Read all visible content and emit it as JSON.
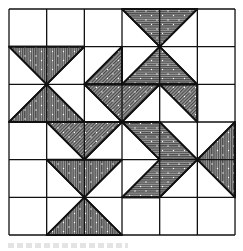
{
  "figure": {
    "type": "quilt-pattern-diagram",
    "grid": {
      "columns": 6,
      "rows": 6,
      "origin_px": [
        9,
        9
      ],
      "cell_px": 37.67,
      "line_color": "#111111",
      "background": "#ffffff"
    },
    "fill": {
      "base_color": "#8c8c8c",
      "hatch_color": "#3a3a3a",
      "speckle_color": "#ffffff"
    },
    "shapes": [
      {
        "id": "top-hourglass-upper",
        "hatch": "horizontal",
        "points": [
          [
            3,
            0
          ],
          [
            5,
            0
          ],
          [
            4,
            1
          ]
        ]
      },
      {
        "id": "center-triangle-up",
        "hatch": "horizontal",
        "points": [
          [
            4,
            1
          ],
          [
            3,
            2
          ],
          [
            5,
            2
          ]
        ]
      },
      {
        "id": "left-hourglass-upper",
        "hatch": "vertical",
        "points": [
          [
            0,
            1
          ],
          [
            2,
            1
          ],
          [
            1,
            2
          ]
        ]
      },
      {
        "id": "left-hourglass-lower",
        "hatch": "vertical",
        "points": [
          [
            1,
            2
          ],
          [
            0,
            3
          ],
          [
            2,
            3
          ]
        ]
      },
      {
        "id": "diag-half-left",
        "hatch": "diagonal",
        "points": [
          [
            3,
            1
          ],
          [
            3,
            2
          ],
          [
            2,
            2
          ]
        ]
      },
      {
        "id": "diag-triangle-down",
        "hatch": "diagonal",
        "points": [
          [
            2,
            2
          ],
          [
            4,
            2
          ],
          [
            3,
            3
          ]
        ]
      },
      {
        "id": "diag-half-right",
        "hatch": "diagonal",
        "points": [
          [
            4,
            2
          ],
          [
            5,
            2
          ],
          [
            5,
            3
          ]
        ]
      },
      {
        "id": "lower-diag-triangle-down",
        "hatch": "diagonal",
        "points": [
          [
            1,
            3
          ],
          [
            3,
            3
          ],
          [
            2,
            4
          ]
        ]
      },
      {
        "id": "lower-hourglass-upper",
        "hatch": "vertical",
        "points": [
          [
            1,
            4
          ],
          [
            3,
            4
          ],
          [
            2,
            5
          ]
        ]
      },
      {
        "id": "lower-hourglass-lower",
        "hatch": "vertical",
        "points": [
          [
            2,
            5
          ],
          [
            1,
            6
          ],
          [
            3,
            6
          ]
        ]
      },
      {
        "id": "chevron",
        "hatch": "horizontal",
        "points": [
          [
            3,
            3
          ],
          [
            4,
            3
          ],
          [
            5,
            4
          ],
          [
            4,
            5
          ],
          [
            3,
            5
          ],
          [
            4,
            4
          ]
        ]
      },
      {
        "id": "right-triangle-left",
        "hatch": "vertical",
        "points": [
          [
            6,
            3
          ],
          [
            5,
            4
          ],
          [
            6,
            5
          ]
        ]
      }
    ],
    "caption": {
      "visible": true,
      "legible": false
    }
  }
}
